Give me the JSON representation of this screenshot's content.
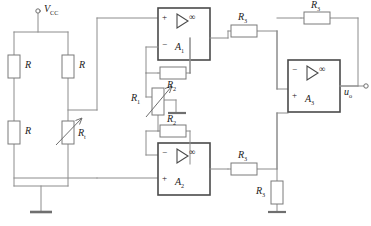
{
  "diagram": {
    "stroke_color": "#8c8c8c",
    "component_stroke": "#7a7a7a",
    "text_color": "#1b1b1b",
    "background": "#ffffff",
    "width": 371,
    "height": 226
  },
  "labels": {
    "vcc": "V",
    "vcc_sub": "CC",
    "bridge_r_tl": "R",
    "bridge_r_tr": "R",
    "bridge_r_bl": "R",
    "thermistor": "R",
    "thermistor_sub": "t",
    "pot": "R",
    "pot_sub": "1",
    "r2_top": "R",
    "r2_top_sub": "2",
    "r2_bottom": "R",
    "r2_bottom_sub": "2",
    "r3_top": "R",
    "r3_top_sub": "3",
    "r3_bottom": "R",
    "r3_bottom_sub": "3",
    "r3_feedback": "R",
    "r3_feedback_sub": "3",
    "r3_ground": "R",
    "r3_ground_sub": "3",
    "amp1": "A",
    "amp1_sub": "1",
    "amp2": "A",
    "amp2_sub": "2",
    "amp3": "A",
    "amp3_sub": "3",
    "output": "u",
    "output_sub": "o",
    "plus": "+",
    "minus": "−",
    "infinity": "∞"
  }
}
